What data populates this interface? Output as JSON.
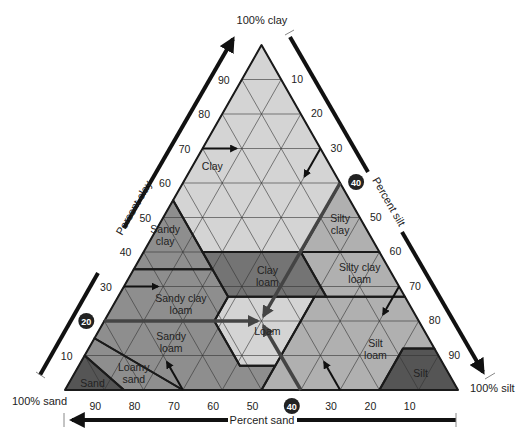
{
  "vertices": {
    "top_label": "100% clay",
    "left_label": "100% sand",
    "right_label": "100% silt"
  },
  "axes": {
    "clay": {
      "label": "Percent clay",
      "ticks": [
        10,
        20,
        30,
        40,
        50,
        60,
        70,
        80,
        90
      ],
      "highlight": 20
    },
    "silt": {
      "label": "Percent silt",
      "ticks": [
        10,
        20,
        30,
        40,
        50,
        60,
        70,
        80,
        90
      ],
      "highlight": 40
    },
    "sand": {
      "label": "Percent sand",
      "ticks": [
        90,
        80,
        70,
        60,
        50,
        40,
        30,
        20,
        10
      ],
      "highlight": 40
    }
  },
  "colors": {
    "light": "#d4d4d4",
    "medium": "#b0b0b0",
    "sandy": "#8e8e8e",
    "clay_loam": "#747474",
    "dark": "#555555",
    "line": "#1a1a1a",
    "arrow": "#444444"
  },
  "chart_data": {
    "type": "ternary",
    "axes": [
      "Percent clay",
      "Percent silt",
      "Percent sand"
    ],
    "grid": true,
    "grid_step": 10,
    "regions": [
      {
        "name": "Clay",
        "label": [
          "Clay"
        ],
        "fill": "light",
        "label_at": [
          30,
          65,
          5
        ],
        "points": [
          [
            0,
            100,
            0
          ],
          [
            45,
            55,
            0
          ],
          [
            45,
            40,
            15
          ],
          [
            20,
            40,
            40
          ],
          [
            0,
            60,
            40
          ]
        ]
      },
      {
        "name": "Silty clay",
        "label": [
          "Silty",
          "clay"
        ],
        "fill": "medium",
        "label_at": [
          6,
          48,
          46
        ],
        "points": [
          [
            0,
            60,
            40
          ],
          [
            20,
            40,
            40
          ],
          [
            0,
            40,
            60
          ]
        ]
      },
      {
        "name": "Sandy clay",
        "label": [
          "Sandy",
          "clay"
        ],
        "fill": "sandy",
        "label_at": [
          52,
          45,
          3
        ],
        "points": [
          [
            45,
            55,
            0
          ],
          [
            65,
            35,
            0
          ],
          [
            45,
            35,
            20
          ]
        ]
      },
      {
        "name": "Clay loam",
        "label": [
          "Clay",
          "loam"
        ],
        "fill": "clay_loam",
        "label_at": [
          32,
          33,
          35
        ],
        "points": [
          [
            45,
            40,
            15
          ],
          [
            45,
            27,
            28
          ],
          [
            20,
            27,
            53
          ],
          [
            20,
            40,
            40
          ]
        ]
      },
      {
        "name": "Silty clay loam",
        "label": [
          "Silty clay",
          "loam"
        ],
        "fill": "medium",
        "label_at": [
          8,
          34,
          58
        ],
        "points": [
          [
            20,
            40,
            40
          ],
          [
            20,
            27,
            53
          ],
          [
            0,
            27,
            73
          ],
          [
            0,
            40,
            60
          ]
        ]
      },
      {
        "name": "Sandy clay loam",
        "label": [
          "Sandy clay",
          "loam"
        ],
        "fill": "sandy",
        "label_at": [
          58,
          25,
          17
        ],
        "points": [
          [
            65,
            35,
            0
          ],
          [
            80,
            20,
            0
          ],
          [
            52,
            20,
            28
          ],
          [
            45,
            27,
            28
          ],
          [
            45,
            35,
            20
          ]
        ]
      },
      {
        "name": "Loam",
        "label": [
          "Loam"
        ],
        "fill": "light",
        "label_at": [
          40,
          17,
          43
        ],
        "points": [
          [
            45,
            27,
            28
          ],
          [
            52,
            20,
            28
          ],
          [
            52,
            7,
            41
          ],
          [
            43,
            7,
            50
          ],
          [
            23,
            27,
            50
          ]
        ]
      },
      {
        "name": "Silt loam",
        "label": [
          "Silt",
          "loam"
        ],
        "fill": "medium",
        "label_at": [
          15,
          12,
          73
        ],
        "points": [
          [
            23,
            27,
            50
          ],
          [
            50,
            0,
            50
          ],
          [
            20,
            0,
            80
          ],
          [
            8,
            12,
            80
          ],
          [
            0,
            12,
            88
          ],
          [
            0,
            27,
            73
          ]
        ]
      },
      {
        "name": "Silt",
        "label": [
          "Silt"
        ],
        "fill": "dark",
        "label_at": [
          7,
          5,
          88
        ],
        "points": [
          [
            20,
            0,
            80
          ],
          [
            0,
            0,
            100
          ],
          [
            0,
            12,
            88
          ],
          [
            8,
            12,
            80
          ]
        ]
      },
      {
        "name": "Sandy loam",
        "label": [
          "Sandy",
          "loam"
        ],
        "fill": "sandy",
        "label_at": [
          66,
          14,
          20
        ],
        "points": [
          [
            80,
            20,
            0
          ],
          [
            52,
            20,
            28
          ],
          [
            52,
            7,
            41
          ],
          [
            43,
            7,
            50
          ],
          [
            50,
            0,
            50
          ],
          [
            70,
            0,
            30
          ],
          [
            85,
            15,
            0
          ]
        ]
      },
      {
        "name": "Loamy sand",
        "label": [
          "Loamy",
          "sand"
        ],
        "fill": "sandy",
        "label_at": [
          80,
          5,
          15
        ],
        "points": [
          [
            85,
            15,
            0
          ],
          [
            70,
            0,
            30
          ],
          [
            85,
            0,
            15
          ],
          [
            90,
            10,
            0
          ]
        ]
      },
      {
        "name": "Sand",
        "label": [
          "Sand"
        ],
        "fill": "dark",
        "label_at": [
          92,
          2,
          6
        ],
        "points": [
          [
            90,
            10,
            0
          ],
          [
            85,
            0,
            15
          ],
          [
            100,
            0,
            0
          ]
        ]
      }
    ],
    "example_point": {
      "sand": 40,
      "silt": 40,
      "clay": 20,
      "classification": "Loam"
    }
  }
}
